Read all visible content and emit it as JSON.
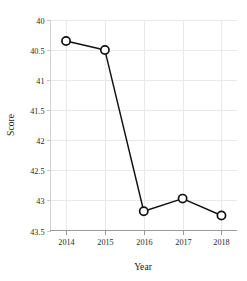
{
  "chart_data": {
    "type": "line",
    "title": "",
    "xlabel": "Year",
    "ylabel": "Score",
    "x": [
      2014,
      2015,
      2016,
      2017,
      2018
    ],
    "categories": [
      "2014",
      "2015",
      "2016",
      "2017",
      "2018"
    ],
    "values": [
      40.35,
      40.5,
      43.18,
      42.97,
      43.25
    ],
    "series": [
      {
        "name": "Score",
        "values": [
          40.35,
          40.5,
          43.18,
          42.97,
          43.25
        ]
      }
    ],
    "xlim": [
      2013.6,
      2018.4
    ],
    "ylim": [
      43.5,
      40.0
    ],
    "y_axis_inverted": true,
    "ytick_labels": [
      "40",
      "40.5",
      "41",
      "41.5",
      "42",
      "42.5",
      "43",
      "43.5"
    ],
    "ytick_values": [
      40,
      40.5,
      41,
      41.5,
      42,
      42.5,
      43,
      43.5
    ],
    "xtick_labels": [
      "2014",
      "2015",
      "2016",
      "2017",
      "2018"
    ],
    "xtick_values": [
      2014,
      2015,
      2016,
      2017,
      2018
    ],
    "grid": true,
    "legend": false,
    "legend_position": "none",
    "marker": "open-circle",
    "line_color": "#111111",
    "marker_face_color": "#ffffff",
    "marker_edge_color": "#111111",
    "grid_color": "#e9e9e9",
    "axis_color": "#9a9a9a",
    "background_color": "#ffffff"
  }
}
